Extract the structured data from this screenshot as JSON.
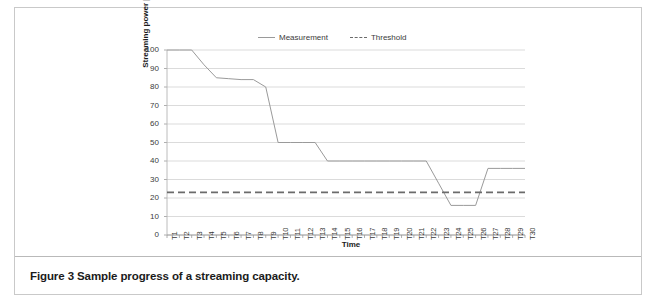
{
  "figure": {
    "caption": "Figure 3 Sample progress of a streaming capacity."
  },
  "chart_data": {
    "type": "line",
    "title": "",
    "xlabel": "Time",
    "ylabel": "Streaming power [%]",
    "ylim": [
      0,
      100
    ],
    "ytick_labels": [
      "100",
      "90",
      "80",
      "70",
      "60",
      "50",
      "40",
      "30",
      "20",
      "10",
      "0"
    ],
    "yticks": [
      100,
      90,
      80,
      70,
      60,
      50,
      40,
      30,
      20,
      10,
      0
    ],
    "grid": "horizontal",
    "legend_position": "top-center",
    "categories": [
      "T1",
      "T2",
      "T3",
      "T4",
      "T5",
      "T6",
      "T7",
      "T8",
      "T9",
      "T10",
      "T11",
      "T12",
      "T13",
      "T14",
      "T15",
      "T16",
      "T17",
      "T18",
      "T19",
      "T20",
      "T21",
      "T22",
      "T23",
      "T24",
      "T25",
      "T26",
      "T27",
      "T28",
      "T29",
      "T30"
    ],
    "series": [
      {
        "name": "Measurement",
        "style": "solid",
        "color": "#9a9a9a",
        "values": [
          100,
          100,
          100,
          92,
          85,
          84.5,
          84,
          84,
          80,
          50,
          50,
          50,
          50,
          40,
          40,
          40,
          40,
          40,
          40,
          40,
          40,
          40,
          28,
          16,
          16,
          16,
          36,
          36,
          36,
          36
        ]
      },
      {
        "name": "Threshold",
        "style": "dashed",
        "color": "#6b6b6b",
        "values": [
          23,
          23,
          23,
          23,
          23,
          23,
          23,
          23,
          23,
          23,
          23,
          23,
          23,
          23,
          23,
          23,
          23,
          23,
          23,
          23,
          23,
          23,
          23,
          23,
          23,
          23,
          23,
          23,
          23,
          23
        ]
      }
    ]
  },
  "legend": {
    "items": [
      {
        "label": "Measurement"
      },
      {
        "label": "Threshold"
      }
    ]
  }
}
